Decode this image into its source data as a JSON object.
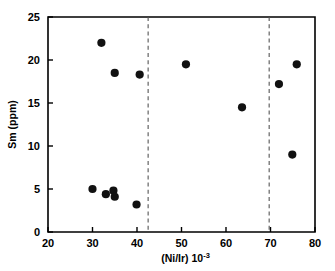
{
  "chart_data": {
    "type": "scatter",
    "title": "",
    "xlabel": "(Ni/Ir) 10-3",
    "xlabel_base": "(Ni/Ir)  10",
    "xlabel_exponent": "-3",
    "ylabel": "Sm (ppm)",
    "xlim": [
      20,
      80
    ],
    "ylim": [
      0,
      25
    ],
    "xticks": [
      20,
      30,
      40,
      50,
      60,
      70,
      80
    ],
    "xtick_labels": [
      "20",
      "30",
      "40",
      "50",
      "60",
      "70",
      "80"
    ],
    "yticks": [
      0,
      5,
      10,
      15,
      20,
      25
    ],
    "ytick_labels": [
      "0",
      "5",
      "10",
      "15",
      "20",
      "25"
    ],
    "grid": false,
    "legend": null,
    "series": [
      {
        "name": "Sm vs Ni/Ir",
        "marker": "filled-circle",
        "color": "#111111",
        "points": [
          {
            "x": 30.0,
            "y": 5.0
          },
          {
            "x": 32.0,
            "y": 22.0
          },
          {
            "x": 33.0,
            "y": 4.4
          },
          {
            "x": 34.7,
            "y": 4.8
          },
          {
            "x": 35.0,
            "y": 18.5
          },
          {
            "x": 35.0,
            "y": 4.1
          },
          {
            "x": 39.9,
            "y": 3.2
          },
          {
            "x": 40.6,
            "y": 18.3
          },
          {
            "x": 51.0,
            "y": 19.5
          },
          {
            "x": 63.6,
            "y": 14.5
          },
          {
            "x": 71.9,
            "y": 17.2
          },
          {
            "x": 74.9,
            "y": 9.0
          },
          {
            "x": 75.9,
            "y": 19.5
          }
        ]
      }
    ],
    "annotations": [
      {
        "name": "divider-left",
        "type": "vertical-dashed-line",
        "x": 42.5
      },
      {
        "name": "divider-right",
        "type": "vertical-dashed-line",
        "x": 69.7
      }
    ]
  }
}
